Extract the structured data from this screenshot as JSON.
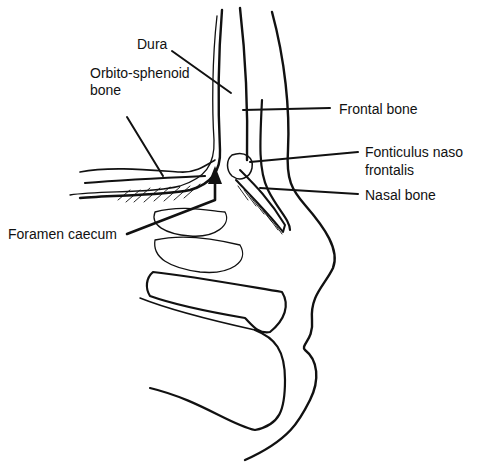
{
  "figure": {
    "labels": {
      "dura": "Dura",
      "orbito_sphenoid_line1": "Orbito-sphenoid",
      "orbito_sphenoid_line2": "bone",
      "frontal_bone": "Frontal bone",
      "fonticulus_line1": "Fonticulus naso",
      "fonticulus_line2": "frontalis",
      "nasal_bone": "Nasal bone",
      "foramen_caecum": "Foramen caecum"
    },
    "colors": {
      "ink": "#111111",
      "background": "#ffffff"
    }
  }
}
